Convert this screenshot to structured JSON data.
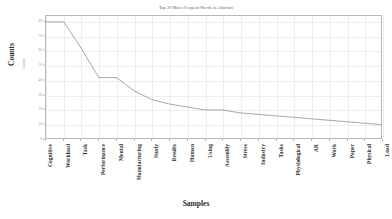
{
  "chart_data": {
    "type": "line",
    "title": "Top 20 Most Frequent Words in Abstract",
    "xlabel": "Samples",
    "ylabel": "Counts",
    "inner_ylabel": "Counts",
    "grid": true,
    "legend": "none",
    "line_color": "#7f7f7f",
    "categories": [
      "Cognitive",
      "Workload",
      "Task",
      "Performance",
      "Mental",
      "Manufacturing",
      "Study",
      "Results",
      "Human",
      "Using",
      "Assembly",
      "Stress",
      "Industry",
      "Tasks",
      "Physiological",
      "AR",
      "Work",
      "Paper",
      "Physical",
      "Load"
    ],
    "values": [
      80,
      80,
      62,
      42,
      42,
      33,
      27,
      24,
      22,
      20,
      20,
      18,
      17,
      16,
      15,
      14,
      13,
      12,
      11,
      10
    ],
    "ylim": [
      0,
      84
    ],
    "yticks": [
      0,
      10,
      20,
      30,
      40,
      50,
      60,
      70,
      80
    ],
    "ytick_labels": [
      "0",
      "10",
      "20",
      "30",
      "40",
      "50",
      "60",
      "70",
      "80"
    ]
  }
}
